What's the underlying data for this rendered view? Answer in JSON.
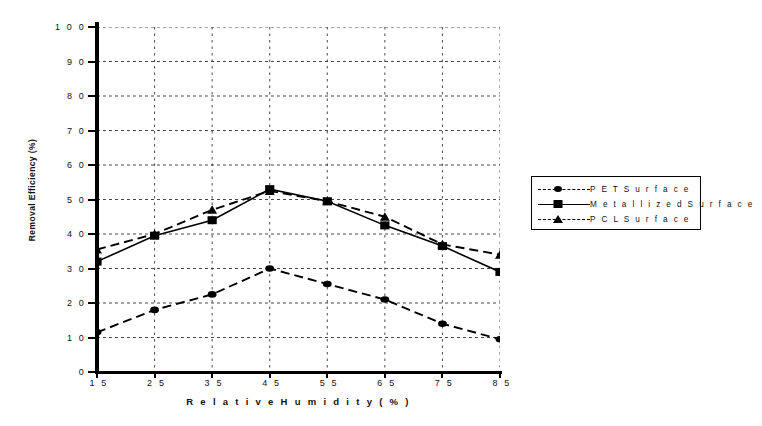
{
  "chart_data": {
    "type": "line",
    "title": "",
    "xlabel": "Relative Humidity (%)",
    "ylabel": "Removal Efficiency (%)",
    "x": [
      15,
      25,
      35,
      45,
      55,
      65,
      75,
      85
    ],
    "xtick_labels": [
      "1 5",
      "2 5",
      "3 5",
      "4 5",
      "5 5",
      "6 5",
      "7 5",
      "8 5"
    ],
    "ytick_labels": [
      "0",
      "1 0",
      "2 0",
      "3 0",
      "4 0",
      "5 0",
      "6 0",
      "7 0",
      "8 0",
      "9 0",
      "1 0 0"
    ],
    "yticks": [
      0,
      10,
      20,
      30,
      40,
      50,
      60,
      70,
      80,
      90,
      100
    ],
    "xlim": [
      15,
      85
    ],
    "ylim": [
      0,
      100
    ],
    "grid": true,
    "grid_style": "dotted",
    "legend_position": "right",
    "series": [
      {
        "name": "PET Surface",
        "legend_label": "P E T   S u r f a c e",
        "marker": "circle",
        "line_style": "dashed",
        "color": "#000000",
        "values": [
          11.5,
          18,
          22.5,
          30,
          25.5,
          21,
          14,
          9.5
        ]
      },
      {
        "name": "Metallized Surface",
        "legend_label": "M e t a l l i z e d   S u r f a c e",
        "marker": "square",
        "line_style": "solid",
        "color": "#000000",
        "values": [
          32,
          39.5,
          44,
          53,
          49.5,
          42.5,
          36.5,
          29
        ]
      },
      {
        "name": "PCL Surface",
        "legend_label": "P C L   S u r f a c e",
        "marker": "triangle",
        "line_style": "dashed",
        "color": "#000000",
        "values": [
          35.5,
          40,
          47,
          52.5,
          49.5,
          45,
          37,
          34
        ]
      }
    ]
  },
  "axes": {
    "x_title": "R e l a t i v e   H u m i d i t y   ( % )",
    "y_title": "Removal Efficiency (%)"
  }
}
